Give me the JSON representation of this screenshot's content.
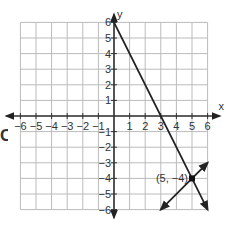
{
  "choice_letter": "C",
  "chart_data": {
    "type": "line",
    "title": "",
    "xlabel": "x",
    "ylabel": "y",
    "xlim": [
      -6,
      6
    ],
    "ylim": [
      -6,
      6
    ],
    "grid": true,
    "x_ticks": [
      "-6",
      "-5",
      "-4",
      "-3",
      "-2",
      "-1",
      "1",
      "2",
      "3",
      "4",
      "5",
      "6"
    ],
    "y_ticks": [
      "6",
      "5",
      "4",
      "3",
      "2",
      "1",
      "-1",
      "-2",
      "-3",
      "-4",
      "-5",
      "-6"
    ],
    "series": [
      {
        "name": "line 1",
        "equation": "y = -2x + 6",
        "points": [
          [
            0,
            6
          ],
          [
            3,
            0
          ],
          [
            6,
            -6
          ]
        ],
        "arrow_end": true
      },
      {
        "name": "line 2",
        "equation": "y = x - 9",
        "points": [
          [
            3,
            -6
          ],
          [
            6,
            -3
          ]
        ],
        "arrow_both": true
      }
    ],
    "annotations": [
      {
        "text": "(5, -4)",
        "x": 5,
        "y": -4,
        "marker": "point"
      }
    ]
  }
}
